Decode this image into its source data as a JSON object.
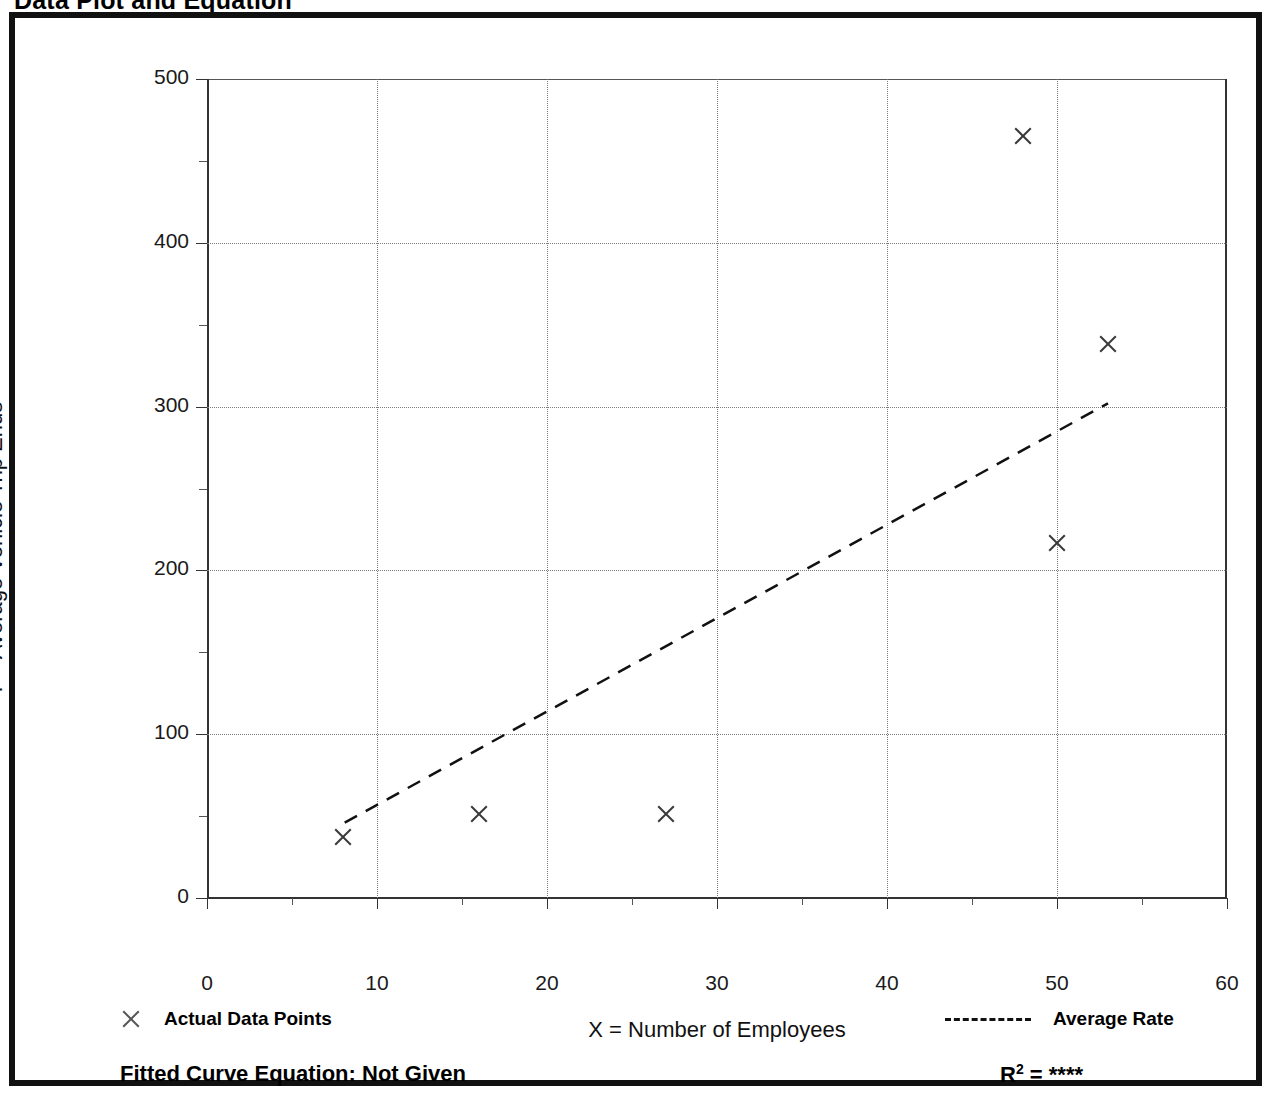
{
  "page_title": "Data Plot and Equation",
  "axis": {
    "x_title": "X = Number of Employees",
    "y_title": "T = Average Vehicle Trip Ends"
  },
  "legend": {
    "points_label": "Actual Data Points",
    "line_label": "Average Rate",
    "point_marker_icon": "x-marker-icon",
    "line_marker_icon": "dashed-line-icon"
  },
  "footer": {
    "equation_label": "Fitted Curve Equation:  Not Given",
    "r_squared_prefix": "R",
    "r_squared_exponent": "2",
    "r_squared_value": "= ****"
  },
  "colors": {
    "frame": "#111111",
    "grid": "#7a7a7a",
    "marker": "#3a3a3a",
    "fit_line": "#111111",
    "text": "#000000"
  },
  "chart_data": {
    "type": "scatter",
    "title": "Data Plot and Equation",
    "xlabel": "X = Number of Employees",
    "ylabel": "T = Average Vehicle Trip Ends",
    "xlim": [
      0,
      60
    ],
    "ylim": [
      0,
      500
    ],
    "xticks": [
      0,
      10,
      20,
      30,
      40,
      50,
      60
    ],
    "xticks_minor": [
      5,
      15,
      25,
      35,
      45,
      55
    ],
    "yticks": [
      0,
      100,
      200,
      300,
      400,
      500
    ],
    "yticks_minor": [
      50,
      150,
      250,
      350,
      450
    ],
    "grid": true,
    "grid_style": "dotted",
    "legend_position": "below-axes",
    "series": [
      {
        "name": "Actual Data Points",
        "type": "scatter",
        "marker": "x",
        "points": [
          {
            "x": 8,
            "y": 37
          },
          {
            "x": 16,
            "y": 51
          },
          {
            "x": 27,
            "y": 51
          },
          {
            "x": 48,
            "y": 465
          },
          {
            "x": 50,
            "y": 217
          },
          {
            "x": 53,
            "y": 338
          }
        ]
      },
      {
        "name": "Average Rate",
        "type": "line",
        "style": "dashed",
        "points": [
          {
            "x": 8.1,
            "y": 46
          },
          {
            "x": 53.0,
            "y": 302
          }
        ]
      }
    ],
    "annotations": [
      "Fitted Curve Equation:  Not Given",
      "R2 = ****"
    ]
  }
}
